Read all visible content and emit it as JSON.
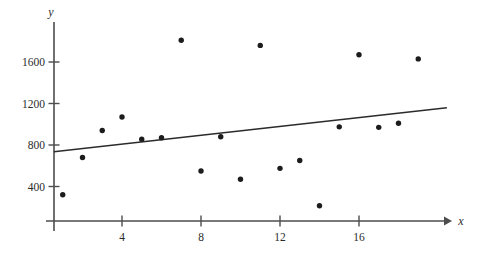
{
  "chart_data": {
    "type": "scatter",
    "title": "",
    "xlabel": "x",
    "ylabel": "y",
    "grid": false,
    "legend": "none",
    "xlim": [
      0,
      20.5
    ],
    "ylim": [
      0,
      1900
    ],
    "xticks": [
      4,
      8,
      12,
      16
    ],
    "yticks": [
      400,
      800,
      1200,
      1600
    ],
    "xtick_labels": [
      "4",
      "8",
      "12",
      "16"
    ],
    "ytick_labels": [
      "400",
      "800",
      "1200",
      "1600"
    ],
    "points": [
      {
        "x": 1,
        "y": 320
      },
      {
        "x": 2,
        "y": 680
      },
      {
        "x": 3,
        "y": 940
      },
      {
        "x": 4,
        "y": 1070
      },
      {
        "x": 5,
        "y": 855
      },
      {
        "x": 6,
        "y": 870
      },
      {
        "x": 7,
        "y": 1810
      },
      {
        "x": 8,
        "y": 550
      },
      {
        "x": 9,
        "y": 880
      },
      {
        "x": 10,
        "y": 470
      },
      {
        "x": 11,
        "y": 1760
      },
      {
        "x": 12,
        "y": 575
      },
      {
        "x": 13,
        "y": 650
      },
      {
        "x": 14,
        "y": 215
      },
      {
        "x": 15,
        "y": 975
      },
      {
        "x": 16,
        "y": 1670
      },
      {
        "x": 17,
        "y": 970
      },
      {
        "x": 18,
        "y": 1010
      },
      {
        "x": 19,
        "y": 1630
      }
    ],
    "trendline": {
      "label": "least-squares regression line",
      "x_start": 0.55,
      "y_start": 735,
      "x_end": 20.45,
      "y_end": 1160
    },
    "colors": {
      "point": "#1c1c1c",
      "axis": "#4d4d4d",
      "trendline": "#2b2b2b",
      "background": "#ffffff"
    }
  }
}
